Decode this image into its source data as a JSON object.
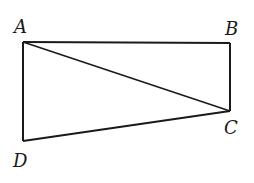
{
  "diagram": {
    "type": "geometry-quadrilateral",
    "stroke_color": "#1a1a1a",
    "background": "#ffffff",
    "points": {
      "A": {
        "label": "A",
        "x": 23,
        "y": 42
      },
      "B": {
        "label": "B",
        "x": 230,
        "y": 43
      },
      "C": {
        "label": "C",
        "x": 230,
        "y": 111
      },
      "D": {
        "label": "D",
        "x": 23,
        "y": 141
      }
    },
    "segments": [
      {
        "from": "A",
        "to": "B"
      },
      {
        "from": "B",
        "to": "C"
      },
      {
        "from": "C",
        "to": "D"
      },
      {
        "from": "D",
        "to": "A"
      },
      {
        "from": "A",
        "to": "C",
        "kind": "diagonal"
      }
    ],
    "labels": {
      "A": "A",
      "B": "B",
      "C": "C",
      "D": "D"
    }
  }
}
